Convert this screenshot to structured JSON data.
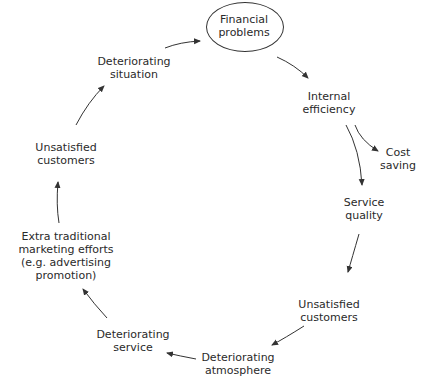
{
  "diagram": {
    "type": "cycle",
    "nodes": [
      {
        "id": "financial-problems",
        "lines": [
          "Financial",
          "problems"
        ],
        "x": 244,
        "y": 8,
        "highlighted": true
      },
      {
        "id": "internal-efficiency",
        "lines": [
          "Internal",
          "efficiency"
        ],
        "x": 349,
        "y": 90
      },
      {
        "id": "cost-saving",
        "lines": [
          "Cost",
          "saving"
        ],
        "x": 398,
        "y": 146
      },
      {
        "id": "service-quality",
        "lines": [
          "Service",
          "quality"
        ],
        "x": 364,
        "y": 196
      },
      {
        "id": "unsatisfied-customers-right",
        "lines": [
          "Unsatisfied",
          "customers"
        ],
        "x": 329,
        "y": 297
      },
      {
        "id": "deteriorating-atmosphere",
        "lines": [
          "Deteriorating",
          "atmosphere"
        ],
        "x": 238,
        "y": 352
      },
      {
        "id": "deteriorating-service",
        "lines": [
          "Deteriorating",
          "service"
        ],
        "x": 131,
        "y": 327
      },
      {
        "id": "extra-marketing",
        "lines": [
          "Extra traditional",
          "marketing efforts",
          "(e.g. advertising",
          "promotion)"
        ],
        "x": 66,
        "y": 230
      },
      {
        "id": "unsatisfied-customers-left",
        "lines": [
          "Unsatisfied",
          "customers"
        ],
        "x": 66,
        "y": 141
      },
      {
        "id": "deteriorating-situation",
        "lines": [
          "Deteriorating",
          "situation"
        ],
        "x": 134,
        "y": 55
      }
    ],
    "edges": [
      {
        "from": "deteriorating-situation",
        "to": "financial-problems"
      },
      {
        "from": "financial-problems",
        "to": "internal-efficiency"
      },
      {
        "from": "internal-efficiency",
        "to": "cost-saving"
      },
      {
        "from": "internal-efficiency",
        "to": "service-quality"
      },
      {
        "from": "service-quality",
        "to": "unsatisfied-customers-right"
      },
      {
        "from": "unsatisfied-customers-right",
        "to": "deteriorating-atmosphere"
      },
      {
        "from": "deteriorating-atmosphere",
        "to": "deteriorating-service"
      },
      {
        "from": "deteriorating-service",
        "to": "extra-marketing"
      },
      {
        "from": "extra-marketing",
        "to": "unsatisfied-customers-left"
      },
      {
        "from": "unsatisfied-customers-left",
        "to": "deteriorating-situation"
      }
    ]
  },
  "colors": {
    "stroke": "#333333",
    "text": "#2a2a2a",
    "background": "#ffffff"
  }
}
